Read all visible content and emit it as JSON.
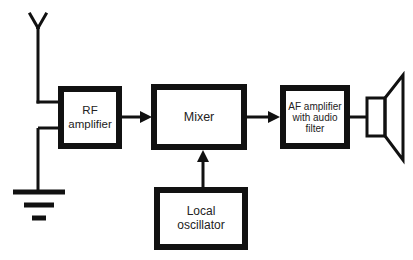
{
  "diagram": {
    "type": "superheterodyne receiver block diagram",
    "blocks": [
      {
        "id": "rf",
        "label_lines": [
          "RF",
          "amplifier"
        ]
      },
      {
        "id": "mixer",
        "label_lines": [
          "Mixer"
        ]
      },
      {
        "id": "lo",
        "label_lines": [
          "Local",
          "oscillator"
        ]
      },
      {
        "id": "af",
        "label_lines": [
          "AF amplifier",
          "with audio",
          "filter"
        ]
      }
    ],
    "connections": [
      {
        "from": "antenna",
        "to": "rf"
      },
      {
        "from": "ground",
        "to": "rf"
      },
      {
        "from": "rf",
        "to": "mixer",
        "arrow": true
      },
      {
        "from": "lo",
        "to": "mixer",
        "arrow": true
      },
      {
        "from": "mixer",
        "to": "af",
        "arrow": true
      },
      {
        "from": "af",
        "to": "speaker"
      }
    ],
    "symbols": [
      "antenna",
      "ground",
      "speaker"
    ],
    "colors": {
      "line": "#111111",
      "text": "#222222",
      "background": "#ffffff"
    }
  }
}
